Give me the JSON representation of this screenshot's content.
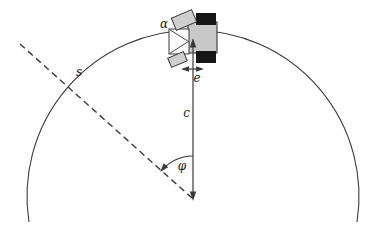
{
  "diagram": {
    "labels": {
      "scanner_angle": "α",
      "arc_length": "s",
      "lateral_offset": "e",
      "center_distance": "c",
      "heading_angle": "φ"
    },
    "colors": {
      "background": "#ffffff",
      "line": "#3a3a3a",
      "label_text": "#1c1c1c",
      "robot_body": "#c8c8c8",
      "wheel": "#161616",
      "scanner_plate": "#cfcfcf",
      "sensor_box": "#fcfcfc"
    }
  }
}
